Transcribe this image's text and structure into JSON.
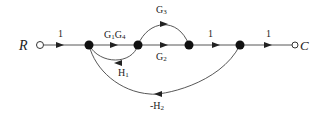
{
  "diagram": {
    "type": "signal-flow-graph",
    "input_label": "R",
    "output_label": "C",
    "edges": [
      {
        "from": "R",
        "to": "n1",
        "gain": "1"
      },
      {
        "from": "n1",
        "to": "n2",
        "gain": "G1G4"
      },
      {
        "from": "n2",
        "to": "n3",
        "gain": "G3",
        "path": "upper-arc"
      },
      {
        "from": "n2",
        "to": "n3",
        "gain": "G2",
        "path": "straight"
      },
      {
        "from": "n2",
        "to": "n1",
        "gain": "H1",
        "path": "feedback"
      },
      {
        "from": "n3",
        "to": "n4",
        "gain": "1"
      },
      {
        "from": "n4",
        "to": "n1",
        "gain": "-H2",
        "path": "feedback"
      },
      {
        "from": "n4",
        "to": "C",
        "gain": "1"
      }
    ],
    "labels": {
      "r_to_n1": "1",
      "g1g4_main": "G",
      "g1g4_sub1": "1",
      "g1g4_g": "G",
      "g1g4_sub2": "4",
      "g3_main": "G",
      "g3_sub": "3",
      "g2_main": "G",
      "g2_sub": "2",
      "h1_main": "H",
      "h1_sub": "1",
      "h2_main": "-H",
      "h2_sub": "2",
      "n3_to_n4": "1",
      "n4_to_c": "1"
    }
  }
}
